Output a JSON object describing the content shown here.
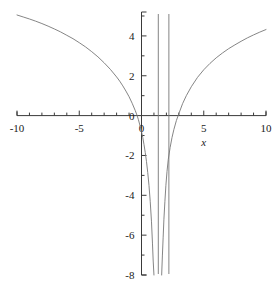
{
  "figure": {
    "name": "function-plot",
    "background_color": "#ffffff",
    "width": 278,
    "height": 286
  },
  "chart_data": {
    "type": "line",
    "title": "",
    "subtitle": "",
    "xlabel": "x",
    "ylabel": "",
    "xlim": [
      -10,
      10
    ],
    "ylim": [
      -8,
      5.2
    ],
    "grid": false,
    "legend": false,
    "legend_position": "none",
    "line_color": "#777777",
    "axis_color": "#3a3a3a",
    "x_ticks_major": [
      -10,
      -5,
      0,
      5,
      10
    ],
    "x_tick_labels": [
      "-10",
      "-5",
      "0",
      "5",
      "10"
    ],
    "x_ticks_minor": [
      -9,
      -8,
      -7,
      -6,
      -4,
      -3,
      -2,
      -1,
      1,
      2,
      3,
      4,
      6,
      7,
      8,
      9
    ],
    "y_ticks_major": [
      4,
      2,
      0,
      -2,
      -4,
      -6,
      -8
    ],
    "y_tick_labels": [
      "4",
      "2",
      "0",
      "-2",
      "-4",
      "-6",
      "-8"
    ],
    "y_ticks_minor": [
      5,
      3,
      1,
      -1,
      -3,
      -5,
      -7
    ],
    "asymptotes": [
      1.35,
      2.2
    ],
    "zero_crossings": [
      0.9,
      2.5
    ],
    "series": [
      {
        "name": "branch-left",
        "points": [
          [
            -10,
            5.05
          ],
          [
            -9.5,
            4.95
          ],
          [
            -9,
            4.85
          ],
          [
            -8.5,
            4.74
          ],
          [
            -8,
            4.62
          ],
          [
            -7.5,
            4.49
          ],
          [
            -7,
            4.35
          ],
          [
            -6.5,
            4.2
          ],
          [
            -6,
            4.03
          ],
          [
            -5.5,
            3.86
          ],
          [
            -5,
            3.66
          ],
          [
            -4.5,
            3.45
          ],
          [
            -4,
            3.21
          ],
          [
            -3.5,
            2.95
          ],
          [
            -3,
            2.65
          ],
          [
            -2.5,
            2.32
          ],
          [
            -2,
            1.94
          ],
          [
            -1.75,
            1.73
          ],
          [
            -1.5,
            1.49
          ],
          [
            -1.25,
            1.23
          ],
          [
            -1,
            0.95
          ],
          [
            -0.75,
            0.62
          ],
          [
            -0.5,
            0.25
          ],
          [
            -0.35,
            0.0
          ],
          [
            -0.25,
            -0.2
          ],
          [
            -0.1,
            -0.55
          ],
          [
            0,
            -0.8
          ],
          [
            0.1,
            -1.1
          ],
          [
            0.2,
            -1.45
          ],
          [
            0.3,
            -1.85
          ],
          [
            0.4,
            -2.3
          ],
          [
            0.5,
            -2.85
          ],
          [
            0.6,
            -3.5
          ],
          [
            0.7,
            -4.3
          ],
          [
            0.8,
            -5.3
          ],
          [
            0.88,
            -6.4
          ],
          [
            0.94,
            -7.3
          ],
          [
            1.0,
            -8
          ]
        ]
      },
      {
        "name": "branch-right",
        "points": [
          [
            1.62,
            -8
          ],
          [
            1.68,
            -7.0
          ],
          [
            1.74,
            -6.1
          ],
          [
            1.8,
            -5.2
          ],
          [
            1.88,
            -4.3
          ],
          [
            1.96,
            -3.5
          ],
          [
            2.05,
            -2.8
          ],
          [
            2.15,
            -2.2
          ],
          [
            2.3,
            -1.6
          ],
          [
            2.45,
            -1.1
          ],
          [
            2.6,
            -0.7
          ],
          [
            2.8,
            -0.25
          ],
          [
            3.0,
            0.1
          ],
          [
            3.3,
            0.6
          ],
          [
            3.6,
            1.0
          ],
          [
            4,
            1.45
          ],
          [
            4.5,
            1.92
          ],
          [
            5,
            2.3
          ],
          [
            5.5,
            2.62
          ],
          [
            6,
            2.9
          ],
          [
            6.5,
            3.14
          ],
          [
            7,
            3.36
          ],
          [
            7.5,
            3.55
          ],
          [
            8,
            3.73
          ],
          [
            8.5,
            3.9
          ],
          [
            9,
            4.05
          ],
          [
            9.5,
            4.19
          ],
          [
            10,
            4.32
          ]
        ]
      }
    ]
  }
}
